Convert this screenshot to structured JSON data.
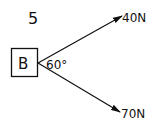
{
  "problem_number": "5",
  "body_label": "B",
  "angle_label": "60°",
  "forces": [
    {
      "label": "40N",
      "direction": "upper-right",
      "magnitude": 40,
      "unit": "N"
    },
    {
      "label": "70N",
      "direction": "lower-right",
      "magnitude": 70,
      "unit": "N"
    }
  ],
  "angle_between_forces_deg": 60,
  "colors": {
    "ink": "#111111",
    "background": "#ffffff"
  }
}
